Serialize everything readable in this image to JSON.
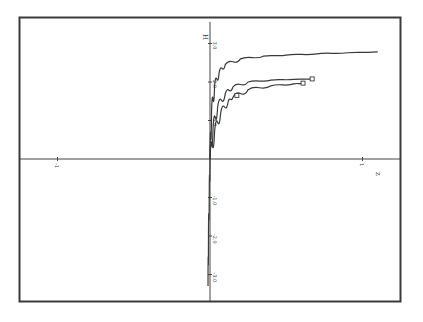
{
  "chart_data": {
    "type": "line",
    "title": "",
    "xlabel": "z",
    "ylabel": "H",
    "xlim": [
      -1.0,
      1.0
    ],
    "ylim": [
      -3.5,
      3.5
    ],
    "grid": false,
    "legend": null,
    "x_ticks": [
      {
        "value": -1.0,
        "label": "-1"
      },
      {
        "value": 1.0,
        "label": "1"
      }
    ],
    "y_ticks": [
      {
        "value": 3.0,
        "label": "3.0"
      },
      {
        "value": 2.0,
        "label": "2.0"
      },
      {
        "value": 1.0,
        "label": "1.0"
      },
      {
        "value": -1.0,
        "label": "-1.0"
      },
      {
        "value": -2.0,
        "label": "-2.0"
      },
      {
        "value": -3.0,
        "label": "-3.0"
      }
    ],
    "series": [
      {
        "name": "upper curve",
        "marker": "none",
        "x": [
          0.0,
          0.01,
          0.03,
          0.06,
          0.1,
          0.2,
          0.35,
          0.5,
          0.7,
          0.9,
          1.1
        ],
        "y": [
          0.0,
          1.2,
          1.9,
          2.25,
          2.45,
          2.6,
          2.67,
          2.7,
          2.73,
          2.76,
          2.78
        ]
      },
      {
        "name": "middle curve",
        "marker": "square-end",
        "x": [
          0.0,
          0.02,
          0.05,
          0.1,
          0.15,
          0.25,
          0.4,
          0.55,
          0.67
        ],
        "y": [
          0.0,
          0.8,
          1.35,
          1.7,
          1.87,
          2.0,
          2.05,
          2.07,
          2.08
        ]
      },
      {
        "name": "lower curve",
        "marker": "square",
        "x": [
          0.0,
          0.03,
          0.07,
          0.12,
          0.15,
          0.25,
          0.4,
          0.55,
          0.61
        ],
        "y": [
          0.0,
          0.7,
          1.2,
          1.5,
          1.6,
          1.8,
          1.9,
          1.95,
          1.97
        ]
      },
      {
        "name": "negative branch",
        "marker": "none",
        "x": [
          0.0,
          -0.005,
          -0.01,
          -0.013
        ],
        "y": [
          0.0,
          -1.0,
          -2.0,
          -3.3
        ]
      }
    ]
  }
}
